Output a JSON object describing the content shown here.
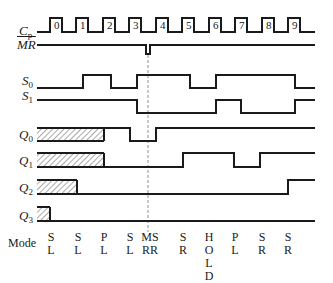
{
  "diagram": {
    "signals": [
      {
        "name": "Cp",
        "base": "C",
        "sub": "p",
        "label_y": 30
      },
      {
        "name": "MR",
        "base": "MR",
        "sub": "",
        "overline": true,
        "label_y": 43
      },
      {
        "name": "S0",
        "base": "S",
        "sub": "0",
        "label_y": 81
      },
      {
        "name": "S1",
        "base": "S",
        "sub": "1",
        "label_y": 95
      },
      {
        "name": "Q0",
        "base": "Q",
        "sub": "0",
        "label_y": 134
      },
      {
        "name": "Q1",
        "base": "Q",
        "sub": "1",
        "label_y": 160
      },
      {
        "name": "Q2",
        "base": "Q",
        "sub": "2",
        "label_y": 187
      },
      {
        "name": "Q3",
        "base": "Q",
        "sub": "3",
        "label_y": 214
      }
    ],
    "clock_pulse_numbers": [
      "0",
      "1",
      "2",
      "3",
      "4",
      "5",
      "6",
      "7",
      "8",
      "9"
    ],
    "mode_label": "Mode",
    "modes": [
      {
        "lines": [
          "S",
          "L"
        ],
        "x": 51
      },
      {
        "lines": [
          "S",
          "L"
        ],
        "x": 78
      },
      {
        "lines": [
          "P",
          "L"
        ],
        "x": 104
      },
      {
        "lines": [
          "S",
          "L"
        ],
        "x": 130
      },
      {
        "lines": [
          "MS",
          "RR"
        ],
        "x": 150
      },
      {
        "lines": [
          "S",
          "R"
        ],
        "x": 183
      },
      {
        "lines": [
          "H",
          "O",
          "L",
          "D"
        ],
        "x": 209
      },
      {
        "lines": [
          "P",
          "L"
        ],
        "x": 235
      },
      {
        "lines": [
          "S",
          "R"
        ],
        "x": 262
      },
      {
        "lines": [
          "S",
          "R"
        ],
        "x": 288
      }
    ],
    "reset_marker_x": 148,
    "line_color": "#1a1a1a",
    "hatch_color": "#555555",
    "dashed_color": "#777777"
  }
}
